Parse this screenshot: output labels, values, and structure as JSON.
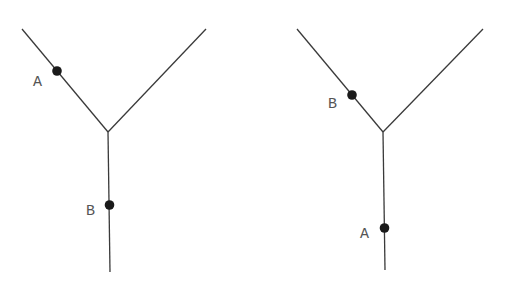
{
  "diagrams": [
    {
      "name": "left",
      "points": [
        {
          "label": "A",
          "branch": "upper-left"
        },
        {
          "label": "B",
          "branch": "stem"
        }
      ]
    },
    {
      "name": "right",
      "points": [
        {
          "label": "B",
          "branch": "upper-left"
        },
        {
          "label": "A",
          "branch": "stem"
        }
      ]
    }
  ],
  "colors": {
    "line": "#3a3a3a",
    "point": "#1a1a1a",
    "label": "#555555"
  }
}
